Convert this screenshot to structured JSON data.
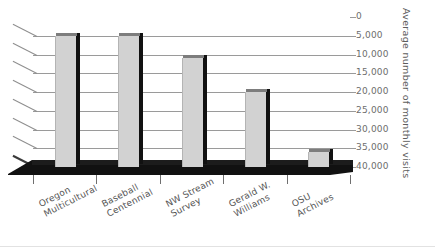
{
  "chart_data": {
    "type": "bar",
    "title": "",
    "xlabel": "",
    "ylabel": "Average number of monthly visits",
    "categories": [
      "Oregon Multicultural",
      "Baseball Centennial",
      "NW Stream Survey",
      "Gerald W. Williams",
      "OSU Archives"
    ],
    "category_lines": [
      [
        "Oregon",
        "Multicultural"
      ],
      [
        "Baseball",
        "Centennial"
      ],
      [
        "NW Stream",
        "Survey"
      ],
      [
        "Gerald W.",
        "Williams"
      ],
      [
        "OSU",
        "Archives"
      ]
    ],
    "values": [
      5000,
      5000,
      11000,
      20000,
      36000
    ],
    "ylim": [
      0,
      40000
    ],
    "ytick_values": [
      0,
      5000,
      10000,
      15000,
      20000,
      25000,
      30000,
      35000,
      40000
    ],
    "ytick_labels": [
      "0",
      "5,000",
      "10,000",
      "15,000",
      "20,000",
      "25,000",
      "30,000",
      "35,000",
      "40,000"
    ],
    "grid": true,
    "legend": false,
    "legend_position": "none",
    "style": "3d-perspective-column",
    "colors": {
      "bar_face": "#d2d2d2",
      "bar_top": "#8c8c8c",
      "bar_side": "#111111",
      "gridline": "#9a9a9a",
      "top_gridline": "#3a3a3a",
      "floor": "#111111",
      "tick_label": "#6d6d6d",
      "axis_title": "#5d5d5d",
      "category_label": "#555555",
      "background": "#ffffff"
    }
  }
}
